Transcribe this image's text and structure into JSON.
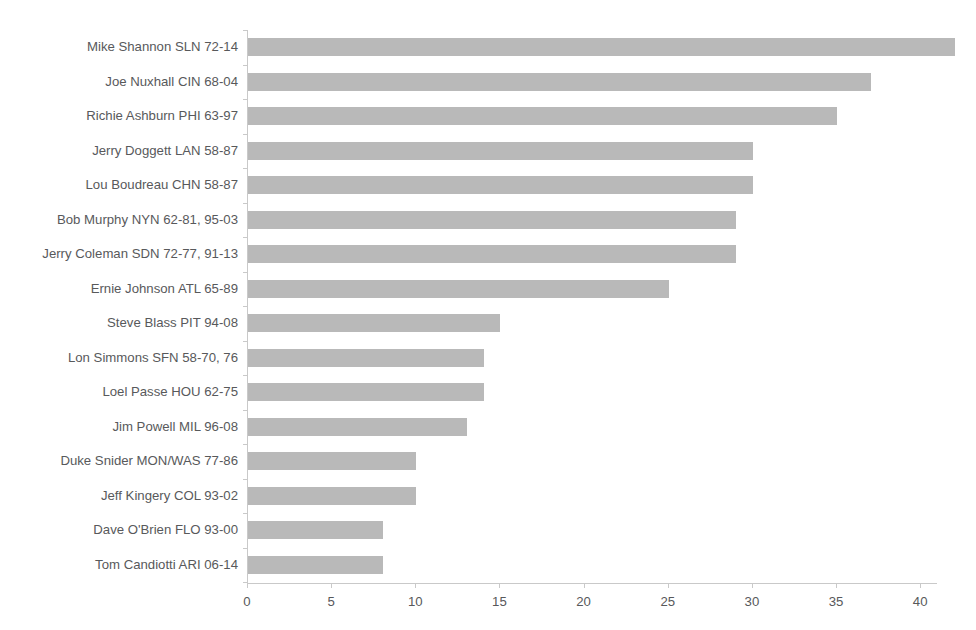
{
  "chart_data": {
    "type": "bar",
    "orientation": "horizontal",
    "title": "",
    "xlabel": "",
    "ylabel": "",
    "xlim": [
      0,
      42.5
    ],
    "xticks": [
      0,
      5,
      10,
      15,
      20,
      25,
      30,
      35,
      40
    ],
    "xtick_labels": [
      "0",
      "5",
      "10",
      "15",
      "20",
      "25",
      "30",
      "35",
      "40"
    ],
    "grid": false,
    "legend": "none",
    "bar_color": "#b9b9b9",
    "axis_color": "#c9c9c9",
    "text_color": "#58595b",
    "categories": [
      "Mike Shannon SLN 72-14",
      "Joe Nuxhall CIN 68-04",
      "Richie Ashburn PHI 63-97",
      "Jerry Doggett LAN 58-87",
      "Lou Boudreau CHN 58-87",
      "Bob Murphy NYN 62-81, 95-03",
      "Jerry Coleman SDN 72-77, 91-13",
      "Ernie Johnson ATL 65-89",
      "Steve Blass PIT 94-08",
      "Lon Simmons SFN 58-70, 76",
      "Loel Passe HOU 62-75",
      "Jim Powell MIL 96-08",
      "Duke Snider MON/WAS 77-86",
      "Jeff Kingery COL 93-02",
      "Dave O'Brien FLO 93-00",
      "Tom Candiotti ARI 06-14"
    ],
    "values": [
      42,
      37,
      35,
      30,
      30,
      29,
      29,
      25,
      15,
      14,
      14,
      13,
      10,
      10,
      8,
      8
    ]
  }
}
